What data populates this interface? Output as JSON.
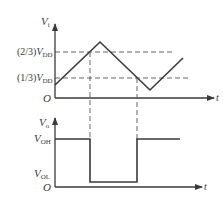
{
  "diagram": {
    "type": "timing-waveform",
    "colors": {
      "line": "#3a3a3a",
      "dashed": "#555555",
      "background": "#ffffff"
    },
    "upper_plot": {
      "y_label": "V",
      "y_label_sub": "i",
      "origin_label": "O",
      "x_label": "t",
      "thresholds": [
        {
          "prefix": "(2/3)",
          "symbol": "V",
          "sub": "DD"
        },
        {
          "prefix": "(1/3)",
          "symbol": "V",
          "sub": "DD"
        }
      ],
      "signal": "triangle"
    },
    "lower_plot": {
      "y_label": "V",
      "y_label_sub": "o",
      "origin_label": "O",
      "x_label": "t",
      "levels": [
        {
          "symbol": "V",
          "sub": "OH"
        },
        {
          "symbol": "V",
          "sub": "OL"
        }
      ],
      "signal": "square"
    }
  }
}
